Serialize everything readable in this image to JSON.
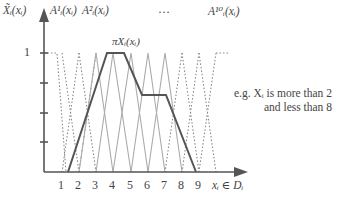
{
  "diagram": {
    "y_axis_label": "X̃ᵢ(xᵢ)",
    "top_labels": [
      {
        "id": "A1",
        "text": "A¹ᵢ(xᵢ)"
      },
      {
        "id": "A2",
        "text": "A²ᵢ(xᵢ)"
      },
      {
        "id": "ellipsis",
        "text": "…"
      },
      {
        "id": "A10",
        "text": "A¹⁰ᵢ(xᵢ)"
      }
    ],
    "y_tick_label_one": "1",
    "pi_label": "π_{Xᵢ}(xᵢ)",
    "pi_label_text": "πXᵢ(xᵢ)",
    "x_tick_labels": [
      "1",
      "2",
      "3",
      "4",
      "5",
      "6",
      "7",
      "8",
      "9"
    ],
    "x_axis_label": "xᵢ ∈ Dᵢ",
    "note_line1": "e.g. Xᵢ is more than 2",
    "note_line2": "and less than 8",
    "colors": {
      "axis": "#555555",
      "pi_curve": "#555555",
      "membership_solid": "#aaaaaa",
      "membership_dotted": "#888888"
    }
  }
}
